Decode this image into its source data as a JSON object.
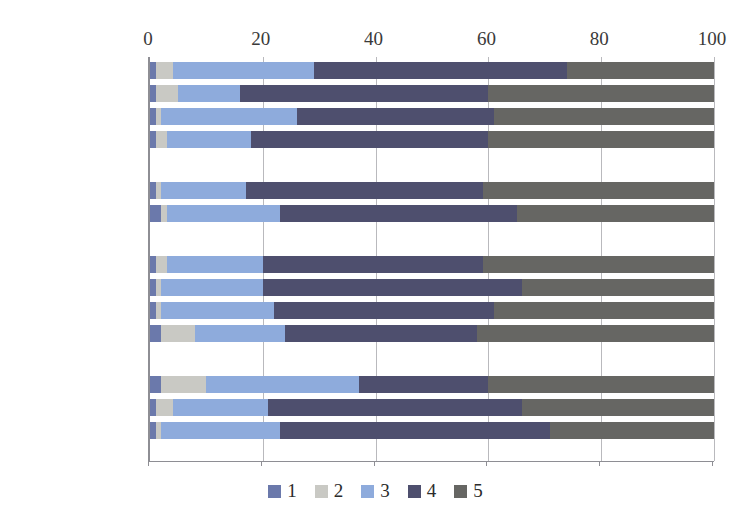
{
  "chart_data": {
    "type": "bar",
    "orientation": "horizontal",
    "stacked": true,
    "stack_total": 100,
    "title": "",
    "xlabel": "",
    "ylabel": "",
    "xlim": [
      0,
      100
    ],
    "xticks": [
      "0",
      "20",
      "40",
      "60",
      "80",
      "100"
    ],
    "xtick_values": [
      0,
      20,
      40,
      60,
      80,
      100
    ],
    "grid": true,
    "axis_position": "top",
    "legend_position": "bottom",
    "legend": [
      {
        "label": "1",
        "color": "#6b79ab"
      },
      {
        "label": "2",
        "color": "#c9c9c4"
      },
      {
        "label": "3",
        "color": "#8eabdc"
      },
      {
        "label": "4",
        "color": "#4e4f6e"
      },
      {
        "label": "5",
        "color": "#666663"
      }
    ],
    "series": [
      {
        "name": "1",
        "color": "#6b79ab"
      },
      {
        "name": "2",
        "color": "#c9c9c4"
      },
      {
        "name": "3",
        "color": "#8eabdc"
      },
      {
        "name": "4",
        "color": "#4e4f6e"
      },
      {
        "name": "5",
        "color": "#666663"
      }
    ],
    "groups": [
      {
        "name": "age",
        "rows": [
          {
            "category": "18—29岁",
            "values": [
              1,
              3,
              25,
              45,
              26
            ]
          },
          {
            "category": "30—39岁",
            "values": [
              1,
              4,
              11,
              44,
              40
            ]
          },
          {
            "category": "40—54岁",
            "values": [
              1,
              1,
              24,
              35,
              39
            ]
          },
          {
            "category": "55—69岁",
            "values": [
              1,
              2,
              15,
              42,
              40
            ]
          }
        ]
      },
      {
        "name": "gender",
        "rows": [
          {
            "category": "男性",
            "values": [
              1,
              1,
              15,
              42,
              41
            ]
          },
          {
            "category": "女性",
            "values": [
              2,
              1,
              20,
              42,
              35
            ]
          }
        ]
      },
      {
        "name": "locality",
        "rows": [
          {
            "category": "雅典",
            "values": [
              1,
              2,
              17,
              39,
              41
            ]
          },
          {
            "category": "大城市",
            "values": [
              1,
              1,
              18,
              46,
              34
            ]
          },
          {
            "category": "其他城镇",
            "values": [
              1,
              1,
              20,
              39,
              39
            ]
          },
          {
            "category": "农村",
            "values": [
              2,
              6,
              16,
              34,
              42
            ]
          }
        ]
      },
      {
        "name": "education",
        "rows": [
          {
            "category": "初等教育",
            "values": [
              2,
              8,
              27,
              23,
              40
            ]
          },
          {
            "category": "中等教育",
            "values": [
              1,
              3,
              17,
              45,
              34
            ]
          },
          {
            "category": "高等教育",
            "values": [
              1,
              1,
              21,
              48,
              29
            ]
          }
        ]
      }
    ]
  }
}
